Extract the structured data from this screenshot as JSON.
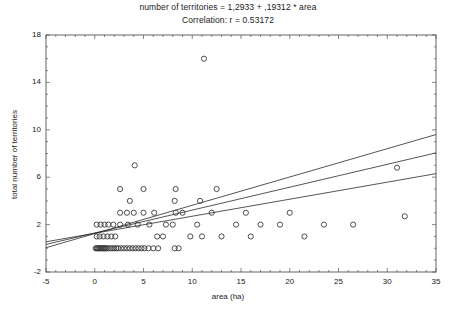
{
  "chart_data": {
    "type": "scatter",
    "title": "number of territories = 1,2933 + ,19312 * area",
    "subtitle": "Correlation: r = 0.53172",
    "xlabel": "area (ha)",
    "ylabel": "total number of territories",
    "xlim": [
      -5,
      35
    ],
    "ylim": [
      -2,
      18
    ],
    "xticks": [
      -5,
      0,
      5,
      10,
      15,
      20,
      25,
      30,
      35
    ],
    "yticks": [
      -2,
      2,
      6,
      10,
      14,
      18
    ],
    "grid": false,
    "legend": false,
    "regression": {
      "intercept": 1.2933,
      "slope": 0.19312,
      "r": 0.53172,
      "fit_line": [
        [
          -5,
          0.3277
        ],
        [
          35,
          8.0524
        ]
      ],
      "confidence_upper": [
        [
          -5,
          0.05
        ],
        [
          35,
          9.6
        ]
      ],
      "confidence_lower": [
        [
          -5,
          0.55
        ],
        [
          35,
          6.3
        ]
      ]
    },
    "marker": {
      "shape": "circle-open",
      "size": 4,
      "edge_color": "#3a3a3a",
      "face_color": "none"
    },
    "points": [
      [
        0.1,
        0.0
      ],
      [
        0.2,
        0.0
      ],
      [
        0.3,
        0.0
      ],
      [
        0.4,
        0.0
      ],
      [
        0.5,
        0.0
      ],
      [
        0.6,
        0.0
      ],
      [
        0.7,
        0.0
      ],
      [
        0.8,
        0.0
      ],
      [
        0.9,
        0.0
      ],
      [
        1.0,
        0.0
      ],
      [
        1.1,
        0.0
      ],
      [
        1.2,
        0.0
      ],
      [
        1.4,
        0.0
      ],
      [
        1.6,
        0.0
      ],
      [
        1.8,
        0.0
      ],
      [
        2.0,
        0.0
      ],
      [
        2.2,
        0.0
      ],
      [
        2.4,
        0.0
      ],
      [
        2.7,
        0.0
      ],
      [
        3.0,
        0.0
      ],
      [
        3.3,
        0.0
      ],
      [
        3.6,
        0.0
      ],
      [
        3.9,
        0.0
      ],
      [
        4.2,
        0.0
      ],
      [
        4.5,
        0.0
      ],
      [
        4.8,
        0.0
      ],
      [
        5.1,
        0.0
      ],
      [
        5.5,
        0.0
      ],
      [
        6.0,
        0.0
      ],
      [
        6.5,
        0.0
      ],
      [
        8.2,
        0.0
      ],
      [
        8.6,
        0.0
      ],
      [
        0.2,
        1.0
      ],
      [
        0.5,
        1.0
      ],
      [
        0.9,
        1.0
      ],
      [
        1.3,
        1.0
      ],
      [
        1.7,
        1.0
      ],
      [
        2.1,
        1.0
      ],
      [
        6.4,
        1.0
      ],
      [
        7.0,
        1.0
      ],
      [
        9.8,
        1.0
      ],
      [
        11.0,
        1.0
      ],
      [
        13.0,
        1.0
      ],
      [
        16.0,
        1.0
      ],
      [
        21.5,
        1.0
      ],
      [
        0.2,
        2.0
      ],
      [
        0.6,
        2.0
      ],
      [
        1.0,
        2.0
      ],
      [
        1.4,
        2.0
      ],
      [
        1.9,
        2.0
      ],
      [
        2.6,
        2.0
      ],
      [
        3.4,
        2.0
      ],
      [
        4.4,
        2.0
      ],
      [
        5.6,
        2.0
      ],
      [
        7.3,
        2.0
      ],
      [
        8.0,
        2.0
      ],
      [
        10.5,
        2.0
      ],
      [
        14.5,
        2.0
      ],
      [
        17.0,
        2.0
      ],
      [
        19.0,
        2.0
      ],
      [
        23.5,
        2.0
      ],
      [
        26.5,
        2.0
      ],
      [
        31.8,
        2.7
      ],
      [
        2.6,
        3.0
      ],
      [
        3.3,
        3.0
      ],
      [
        4.0,
        3.0
      ],
      [
        5.0,
        3.0
      ],
      [
        6.1,
        3.0
      ],
      [
        8.3,
        3.0
      ],
      [
        9.0,
        3.0
      ],
      [
        12.0,
        3.0
      ],
      [
        15.5,
        3.0
      ],
      [
        20.0,
        3.0
      ],
      [
        3.6,
        4.0
      ],
      [
        8.2,
        4.0
      ],
      [
        10.8,
        4.0
      ],
      [
        2.6,
        5.0
      ],
      [
        5.0,
        5.0
      ],
      [
        8.3,
        5.0
      ],
      [
        12.5,
        5.0
      ],
      [
        31.0,
        6.8
      ],
      [
        4.1,
        7.0
      ],
      [
        11.2,
        16.0
      ]
    ]
  },
  "axes": {
    "x_tick_labels": [
      "-5",
      "0",
      "5",
      "10",
      "15",
      "20",
      "25",
      "30",
      "35"
    ],
    "y_tick_labels": [
      "-2",
      "2",
      "6",
      "10",
      "14",
      "18"
    ]
  }
}
